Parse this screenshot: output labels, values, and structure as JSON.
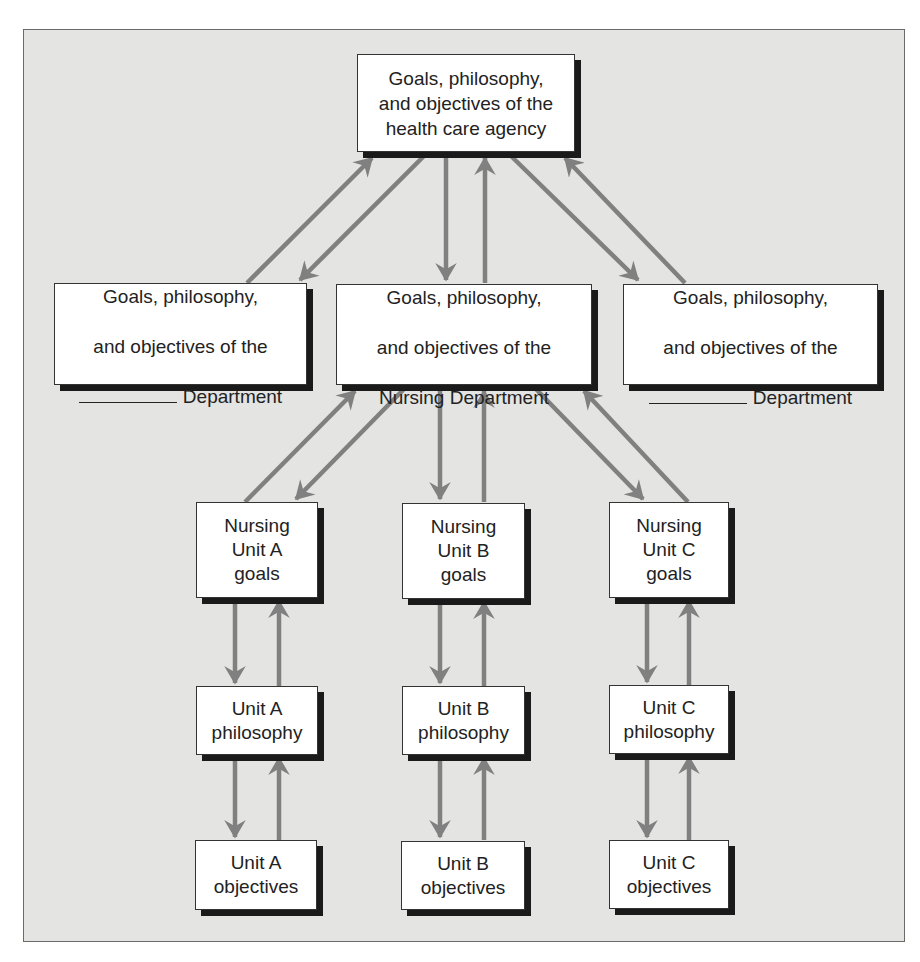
{
  "colors": {
    "background": "#e4e4e2",
    "box_fill": "#ffffff",
    "box_shadow": "#1a1a1a",
    "arrow": "#808080",
    "text": "#222222"
  },
  "agency": {
    "label": "Goals, philosophy,\nand objectives of the\nhealth care agency"
  },
  "departments": [
    {
      "line1": "Goals, philosophy,",
      "line2": "and objectives of the",
      "line3_blank": true,
      "line3": "Department"
    },
    {
      "line1": "Goals, philosophy,",
      "line2": "and objectives of the",
      "line3_blank": false,
      "line3": "Nursing Department"
    },
    {
      "line1": "Goals, philosophy,",
      "line2": "and objectives of the",
      "line3_blank": true,
      "line3": "Department"
    }
  ],
  "units": [
    {
      "goals": "Nursing\nUnit A\ngoals",
      "philosophy": "Unit A\nphilosophy",
      "objectives": "Unit A\nobjectives"
    },
    {
      "goals": "Nursing\nUnit B\ngoals",
      "philosophy": "Unit B\nphilosophy",
      "objectives": "Unit B\nobjectives"
    },
    {
      "goals": "Nursing\nUnit C\ngoals",
      "philosophy": "Unit C\nphilosophy",
      "objectives": "Unit C\nobjectives"
    }
  ]
}
